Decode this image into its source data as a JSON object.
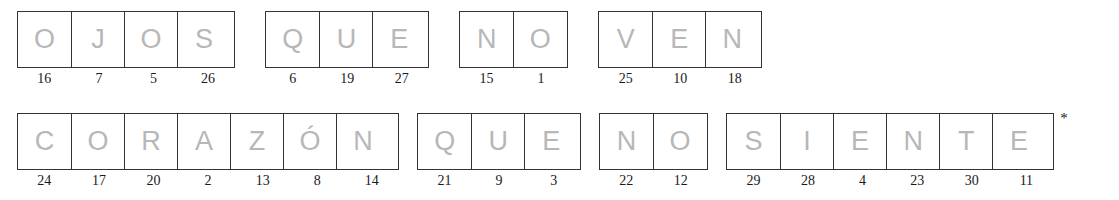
{
  "puzzle": {
    "letter_color": "#b7b7b7",
    "border_color": "#333333",
    "clue_color": "#1a1a1a",
    "background": "#ffffff",
    "footnote_marker": "*",
    "rows": [
      {
        "groups": [
          {
            "word": "OJOS",
            "letters": [
              "O",
              "J",
              "O",
              "S"
            ],
            "clues": [
              "16",
              "7",
              "5",
              "26"
            ]
          },
          {
            "word": "QUE",
            "letters": [
              "Q",
              "U",
              "E"
            ],
            "clues": [
              "6",
              "19",
              "27"
            ]
          },
          {
            "word": "NO",
            "letters": [
              "N",
              "O"
            ],
            "clues": [
              "15",
              "1"
            ]
          },
          {
            "word": "VEN",
            "letters": [
              "V",
              "E",
              "N"
            ],
            "clues": [
              "25",
              "10",
              "18"
            ]
          }
        ]
      },
      {
        "groups": [
          {
            "word": "CORAZÓN",
            "letters": [
              "C",
              "O",
              "R",
              "A",
              "Z",
              "Ó",
              "N"
            ],
            "clues": [
              "24",
              "17",
              "20",
              "2",
              "13",
              "8",
              "14"
            ]
          },
          {
            "word": "QUE",
            "letters": [
              "Q",
              "U",
              "E"
            ],
            "clues": [
              "21",
              "9",
              "3"
            ]
          },
          {
            "word": "NO",
            "letters": [
              "N",
              "O"
            ],
            "clues": [
              "22",
              "12"
            ]
          },
          {
            "word": "SIENTE",
            "letters": [
              "S",
              "I",
              "E",
              "N",
              "T",
              "E"
            ],
            "clues": [
              "29",
              "28",
              "4",
              "23",
              "30",
              "11"
            ],
            "marker": "*"
          }
        ]
      }
    ],
    "full_phrase": "OJOS QUE NO VEN CORAZÓN QUE NO SIENTE"
  }
}
